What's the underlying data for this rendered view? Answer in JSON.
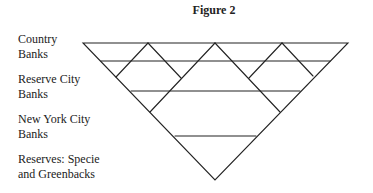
{
  "figure": {
    "title": "Figure 2",
    "labels": [
      {
        "line1": "Country",
        "line2": "Banks"
      },
      {
        "line1": "Reserve City",
        "line2": "Banks"
      },
      {
        "line1": "New York City",
        "line2": "Banks"
      },
      {
        "line1": "Reserves: Specie",
        "line2": "and Greenbacks"
      }
    ],
    "colors": {
      "stroke": "#222222",
      "background": "#ffffff"
    }
  }
}
